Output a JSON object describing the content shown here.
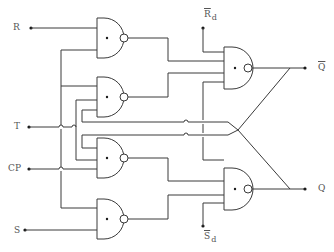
{
  "diagram": {
    "type": "logic-circuit",
    "inputs": {
      "R": "R",
      "T": "T",
      "CP": "CP",
      "S": "S"
    },
    "async_inputs": {
      "reset_main": "R",
      "reset_sub": "d",
      "set_main": "S",
      "set_sub": "d"
    },
    "outputs": {
      "q_bar": "Q",
      "q": "Q"
    },
    "gates": [
      {
        "id": "G1",
        "type": "NAND",
        "inputs": [
          "R",
          "S-side feedback"
        ]
      },
      {
        "id": "G2",
        "type": "NAND",
        "inputs": [
          "feedback",
          "T",
          "Q feedback"
        ]
      },
      {
        "id": "G3",
        "type": "NAND",
        "inputs": [
          "Q-bar feedback",
          "T",
          "CP"
        ]
      },
      {
        "id": "G4",
        "type": "NAND",
        "inputs": [
          "CP-side feedback",
          "S"
        ]
      },
      {
        "id": "G5",
        "type": "NAND",
        "inputs": [
          "Rd-bar",
          "G1",
          "G2",
          "Q"
        ],
        "output": "Q-bar"
      },
      {
        "id": "G6",
        "type": "NAND",
        "inputs": [
          "Q-bar",
          "G3",
          "G4",
          "Sd-bar"
        ],
        "output": "Q"
      }
    ]
  },
  "colors": {
    "wire": "#3a3a3a",
    "label": "#555555",
    "background": "#ffffff"
  }
}
